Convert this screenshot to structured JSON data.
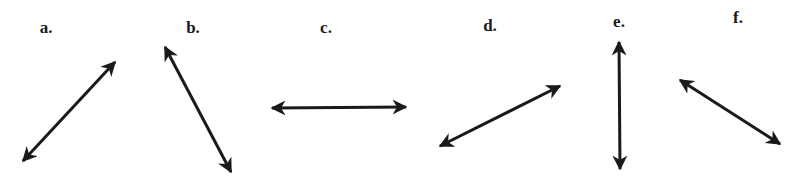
{
  "figure": {
    "background": "#ffffff",
    "stroke_color": "#1a1a1a",
    "items": [
      {
        "label": "a.",
        "label_pos": [
          46,
          28
        ],
        "arrow": {
          "from": [
            23,
            161
          ],
          "to": [
            115,
            62
          ],
          "heads": "both"
        }
      },
      {
        "label": "b.",
        "label_pos": [
          193,
          28
        ],
        "arrow": {
          "from": [
            165,
            47
          ],
          "to": [
            231,
            172
          ],
          "heads": "both"
        }
      },
      {
        "label": "c.",
        "label_pos": [
          326,
          28
        ],
        "arrow": {
          "from": [
            272,
            108
          ],
          "to": [
            406,
            107
          ],
          "heads": "both"
        }
      },
      {
        "label": "d.",
        "label_pos": [
          490,
          26
        ],
        "arrow": {
          "from": [
            440,
            146
          ],
          "to": [
            560,
            86
          ],
          "heads": "both"
        }
      },
      {
        "label": "e.",
        "label_pos": [
          619,
          22
        ],
        "arrow": {
          "from": [
            619,
            42
          ],
          "to": [
            620,
            169
          ],
          "heads": "both"
        }
      },
      {
        "label": "f.",
        "label_pos": [
          738,
          18
        ],
        "arrow": {
          "from": [
            680,
            80
          ],
          "to": [
            780,
            144
          ],
          "heads": "both"
        }
      }
    ]
  }
}
